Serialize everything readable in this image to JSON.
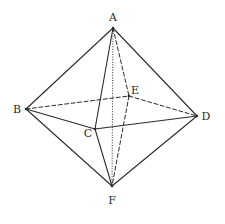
{
  "figure": {
    "type": "octahedron",
    "width": 225,
    "height": 224,
    "colors": {
      "line": "#2b2b2b",
      "background": "#ffffff"
    }
  },
  "vertices": {
    "A": {
      "label": "A",
      "x": 113,
      "y": 28,
      "label_x": 113,
      "label_y": 18
    },
    "B": {
      "label": "B",
      "x": 26,
      "y": 109,
      "label_x": 17,
      "label_y": 110
    },
    "C": {
      "label": "C",
      "x": 95,
      "y": 129,
      "label_x": 88,
      "label_y": 134
    },
    "D": {
      "label": "D",
      "x": 197,
      "y": 116,
      "label_x": 206,
      "label_y": 117
    },
    "E": {
      "label": "E",
      "x": 129,
      "y": 96,
      "label_x": 135,
      "label_y": 91
    },
    "F": {
      "label": "F",
      "x": 112,
      "y": 186,
      "label_x": 112,
      "label_y": 201
    }
  },
  "edges": [
    {
      "from": "A",
      "to": "B",
      "style": "solid"
    },
    {
      "from": "A",
      "to": "D",
      "style": "solid"
    },
    {
      "from": "A",
      "to": "C",
      "style": "solid"
    },
    {
      "from": "B",
      "to": "C",
      "style": "solid"
    },
    {
      "from": "C",
      "to": "D",
      "style": "solid"
    },
    {
      "from": "B",
      "to": "F",
      "style": "solid"
    },
    {
      "from": "C",
      "to": "F",
      "style": "solid"
    },
    {
      "from": "D",
      "to": "F",
      "style": "solid"
    },
    {
      "from": "B",
      "to": "E",
      "style": "dashed"
    },
    {
      "from": "E",
      "to": "D",
      "style": "dashed"
    },
    {
      "from": "A",
      "to": "E",
      "style": "dashed"
    },
    {
      "from": "E",
      "to": "F",
      "style": "dashed"
    },
    {
      "from": "A",
      "to": "F",
      "style": "dotted"
    }
  ]
}
